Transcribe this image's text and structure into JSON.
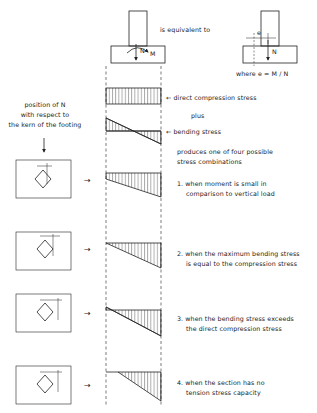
{
  "header": {
    "equivalent_label": "is equivalent to",
    "where_label": "where  e  =  M / N",
    "force_N": "N",
    "moment_M": "M",
    "ecc_e": "e"
  },
  "left_caption": {
    "line1": "position of N",
    "line2": "with respect to",
    "line3": "the kern of the footing"
  },
  "stress_labels": {
    "direct": "←  direct compression stress",
    "plus": "plus",
    "bending": "←  bending stress",
    "produces1": "produces one of four possible",
    "produces2": "stress combinations"
  },
  "cases": [
    {
      "line1": "1.  when moment is small in",
      "line2": "comparison to vertical load"
    },
    {
      "line1": "2.  when the maximum bending stress",
      "line2": "is equal to the compression stress"
    },
    {
      "line1": "3.  when the bending stress exceeds",
      "line2": "the direct compression stress"
    },
    {
      "line1": "4.  when the section has no",
      "line2": "tension stress capacity"
    }
  ],
  "arrow_glyph": "→"
}
